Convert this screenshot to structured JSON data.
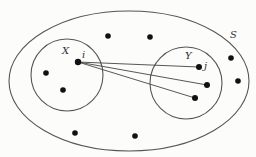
{
  "diagram": {
    "type": "set-diagram",
    "colors": {
      "stroke": "#555555",
      "point": "#111111",
      "text": "#333333",
      "background": "#fcfcfb"
    },
    "outer_set": {
      "label": "S",
      "cx": 129,
      "cy": 81,
      "rx": 120,
      "ry": 70,
      "label_pos": [
        230,
        38
      ]
    },
    "subset_x": {
      "label": "X",
      "cx": 67,
      "cy": 75,
      "r": 36,
      "label_pos": [
        62,
        54
      ]
    },
    "subset_y": {
      "label": "Y",
      "cx": 186,
      "cy": 83,
      "r": 36,
      "label_pos": [
        185,
        59
      ]
    },
    "node_i": {
      "label": "i",
      "x": 78,
      "y": 62,
      "label_pos": [
        82,
        58
      ]
    },
    "node_j": {
      "label": "j",
      "x": 199,
      "y": 67,
      "label_pos": [
        204,
        69
      ]
    },
    "points_in_x": [
      {
        "x": 46,
        "y": 73
      },
      {
        "x": 63,
        "y": 90
      }
    ],
    "points_in_y": [
      {
        "x": 207,
        "y": 85
      },
      {
        "x": 195,
        "y": 98
      }
    ],
    "points_in_s": [
      {
        "x": 108,
        "y": 36
      },
      {
        "x": 150,
        "y": 37
      },
      {
        "x": 231,
        "y": 58
      },
      {
        "x": 238,
        "y": 81
      },
      {
        "x": 75,
        "y": 133
      },
      {
        "x": 135,
        "y": 136
      }
    ],
    "edges_from_i": [
      {
        "to": [
          199,
          67
        ]
      },
      {
        "to": [
          207,
          85
        ]
      },
      {
        "to": [
          195,
          98
        ]
      }
    ]
  }
}
